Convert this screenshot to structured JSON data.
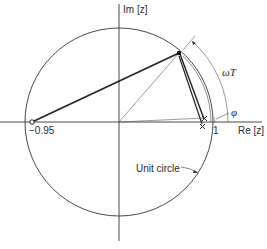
{
  "diagram": {
    "type": "z-plane pole-zero plot",
    "axes": {
      "imag_label": "Im [z]",
      "real_label": "Re [z]"
    },
    "labels": {
      "zero_value": "−0.95",
      "one_value": "1",
      "omega_t": "ωT",
      "phi": "φ",
      "unit_circle": "Unit circle"
    },
    "elements": {
      "zero": {
        "z": -0.95,
        "marker": "open-circle"
      },
      "poles": [
        {
          "marker": "x",
          "position": "near z=1, slightly above real axis"
        },
        {
          "marker": "x",
          "position": "near z=1, slightly below real axis"
        }
      ],
      "evaluation_point": {
        "marker": "filled-dot",
        "on": "unit circle at angle ωT"
      },
      "angle_omega_t": "arc from real axis to evaluation point",
      "angle_phi": "small pole angle"
    },
    "colors": {
      "ink": "#2a2a2a",
      "background": "#ffffff"
    }
  }
}
